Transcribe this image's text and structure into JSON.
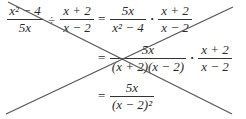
{
  "math": {
    "row1": {
      "f1_num": "x² − 4",
      "f1_den": "5x",
      "div": "÷",
      "f2_num": "x + 2",
      "f2_den": "x − 2",
      "eq": "=",
      "f3_num": "5x",
      "f3_den": "x² − 4",
      "dot": "·",
      "f4_num": "x + 2",
      "f4_den": "x − 2"
    },
    "row2": {
      "eq": "=",
      "f1_num": "5x",
      "f1_den": "(x + 2)(x − 2)",
      "dot": "·",
      "f2_num": "x + 2",
      "f2_den": "x − 2"
    },
    "row3": {
      "eq": "=",
      "f1_num": "5x",
      "f1_den": "(x − 2)²"
    }
  },
  "strike_lines": [
    {
      "x1": 8,
      "y1": 2,
      "x2": 232,
      "y2": 114
    },
    {
      "x1": 233,
      "y1": 7,
      "x2": 6,
      "y2": 114
    }
  ],
  "colors": {
    "text": "#2a2a2a",
    "line": "#555555",
    "background": "#ffffff"
  }
}
